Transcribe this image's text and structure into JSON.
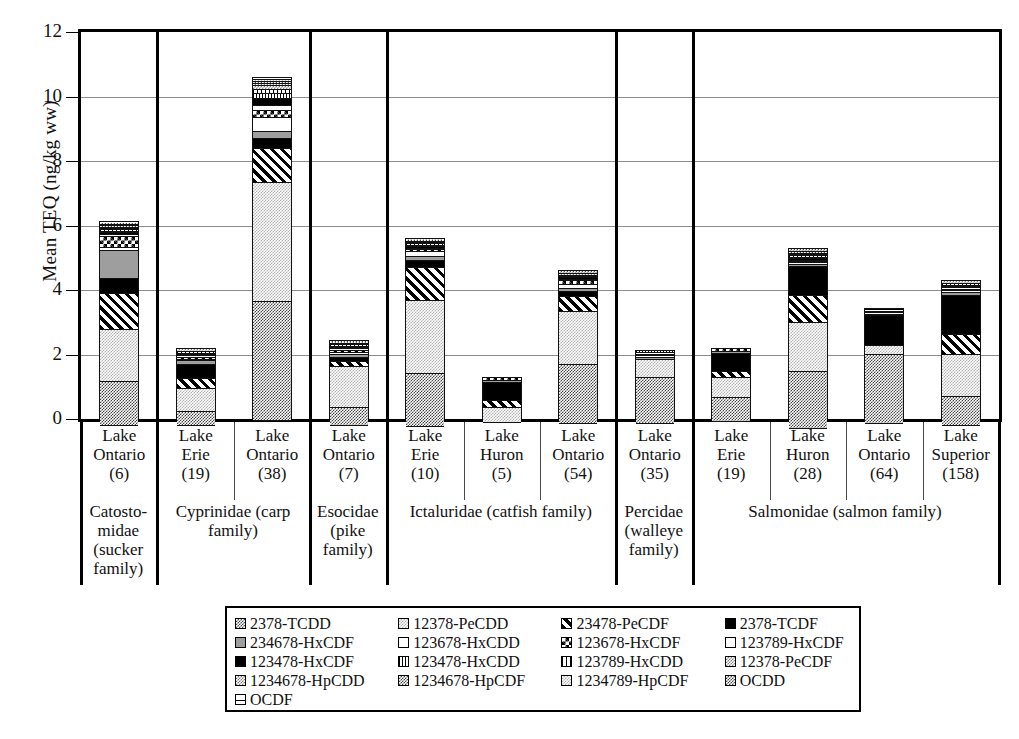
{
  "chart_data": {
    "type": "bar",
    "subtype": "stacked-bar",
    "title": "",
    "xlabel": "",
    "ylabel": "Mean TEQ (ng/kg ww)",
    "ylim": [
      0,
      12
    ],
    "yticks": [
      0,
      2,
      4,
      6,
      8,
      10,
      12
    ],
    "grid": true,
    "legend_position": "bottom",
    "categories": [
      "Lake Ontario (6)",
      "Lake Erie (19)",
      "Lake Ontario (38)",
      "Lake Ontario (7)",
      "Lake Erie (10)",
      "Lake Huron (5)",
      "Lake Ontario (54)",
      "Lake Ontario (35)",
      "Lake Erie (19)",
      "Lake Huron (28)",
      "Lake Ontario (64)",
      "Lake Superior (158)"
    ],
    "totals": [
      6.1,
      2.2,
      10.6,
      2.45,
      5.6,
      1.3,
      4.6,
      2.15,
      2.2,
      5.3,
      3.45,
      4.3
    ],
    "series": [
      {
        "name": "2378-TCDD",
        "values": [
          1.35,
          0.42,
          3.7,
          0.55,
          1.62,
          0.0,
          1.85,
          1.42,
          0.75,
          1.78,
          2.15,
          0.88
        ]
      },
      {
        "name": "12378-PeCDD",
        "values": [
          1.62,
          0.72,
          3.7,
          1.25,
          2.28,
          0.45,
          1.65,
          0.55,
          0.62,
          1.52,
          0.28,
          1.32
        ]
      },
      {
        "name": "23478-PeCDF",
        "values": [
          1.12,
          0.32,
          1.05,
          0.16,
          1.02,
          0.22,
          0.46,
          0.0,
          0.17,
          0.82,
          0.0,
          0.62
        ]
      },
      {
        "name": "2378-TCDF",
        "values": [
          0.46,
          0.42,
          0.3,
          0.14,
          0.22,
          0.58,
          0.14,
          0.0,
          0.58,
          0.92,
          0.92,
          1.22
        ]
      },
      {
        "name": "234678-HxCDF",
        "values": [
          0.85,
          0.12,
          0.22,
          0.1,
          0.11,
          0.02,
          0.1,
          0.08,
          0.04,
          0.06,
          0.04,
          0.09
        ]
      },
      {
        "name": "123678-HxCDD",
        "values": [
          0.12,
          0.05,
          0.44,
          0.06,
          0.16,
          0.01,
          0.14,
          0.04,
          0.02,
          0.04,
          0.02,
          0.05
        ]
      },
      {
        "name": "123678-HxCDF",
        "values": [
          0.34,
          0.06,
          0.2,
          0.06,
          0.07,
          0.01,
          0.1,
          0.03,
          0.01,
          0.03,
          0.01,
          0.04
        ]
      },
      {
        "name": "123789-HxCDF",
        "values": [
          0.06,
          0.02,
          0.18,
          0.03,
          0.04,
          0.0,
          0.05,
          0.01,
          0.0,
          0.02,
          0.01,
          0.02
        ]
      },
      {
        "name": "123478-HxCDF",
        "values": [
          0.05,
          0.02,
          0.2,
          0.03,
          0.03,
          0.0,
          0.04,
          0.01,
          0.0,
          0.02,
          0.01,
          0.02
        ]
      },
      {
        "name": "123478-HxCDD",
        "values": [
          0.04,
          0.01,
          0.16,
          0.02,
          0.02,
          0.0,
          0.03,
          0.01,
          0.0,
          0.02,
          0.0,
          0.01
        ]
      },
      {
        "name": "123789-HxCDD",
        "values": [
          0.03,
          0.01,
          0.12,
          0.02,
          0.01,
          0.0,
          0.02,
          0.0,
          0.0,
          0.01,
          0.0,
          0.01
        ]
      },
      {
        "name": "12378-PeCDF",
        "values": [
          0.03,
          0.01,
          0.12,
          0.01,
          0.01,
          0.0,
          0.01,
          0.0,
          0.0,
          0.01,
          0.0,
          0.01
        ]
      },
      {
        "name": "1234678-HpCDD",
        "values": [
          0.02,
          0.01,
          0.08,
          0.01,
          0.01,
          0.0,
          0.01,
          0.0,
          0.0,
          0.01,
          0.0,
          0.01
        ]
      },
      {
        "name": "1234678-HpCDF",
        "values": [
          0.02,
          0.0,
          0.06,
          0.01,
          0.01,
          0.0,
          0.01,
          0.0,
          0.0,
          0.01,
          0.0,
          0.0
        ]
      },
      {
        "name": "1234789-HpCDF",
        "values": [
          0.01,
          0.0,
          0.04,
          0.0,
          0.01,
          0.0,
          0.0,
          0.0,
          0.0,
          0.01,
          0.0,
          0.0
        ]
      },
      {
        "name": "OCDD",
        "values": [
          0.01,
          0.0,
          0.03,
          0.0,
          0.0,
          0.0,
          0.0,
          0.0,
          0.0,
          0.01,
          0.0,
          0.0
        ]
      },
      {
        "name": "OCDF",
        "values": [
          0.01,
          0.0,
          0.02,
          0.0,
          0.0,
          0.0,
          0.0,
          0.0,
          0.0,
          0.0,
          0.0,
          0.0
        ]
      }
    ]
  },
  "axis": {
    "y_title": "Mean TEQ (ng/kg ww)",
    "ticks": [
      "12",
      "10",
      "8",
      "6",
      "4",
      "2",
      "0"
    ]
  },
  "lakes": [
    {
      "name": "Lake Ontario",
      "n": "(6)"
    },
    {
      "name": "Lake Erie",
      "n": "(19)"
    },
    {
      "name": "Lake Ontario",
      "n": "(38)"
    },
    {
      "name": "Lake Ontario",
      "n": "(7)"
    },
    {
      "name": "Lake Erie",
      "n": "(10)"
    },
    {
      "name": "Lake Huron",
      "n": "(5)"
    },
    {
      "name": "Lake Ontario",
      "n": "(54)"
    },
    {
      "name": "Lake Ontario",
      "n": "(35)"
    },
    {
      "name": "Lake Erie",
      "n": "(19)"
    },
    {
      "name": "Lake Huron",
      "n": "(28)"
    },
    {
      "name": "Lake Ontario",
      "n": "(64)"
    },
    {
      "name": "Lake Superior",
      "n": "(158)"
    }
  ],
  "families": [
    {
      "label": "Catosto-midae (sucker family)",
      "span": 1
    },
    {
      "label": "Cyprinidae (carp family)",
      "span": 2
    },
    {
      "label": "Esocidae (pike family)",
      "span": 1
    },
    {
      "label": "Ictaluridae (catfish family)",
      "span": 3
    },
    {
      "label": "Percidae (walleye family)",
      "span": 1
    },
    {
      "label": "Salmonidae (salmon family)",
      "span": 4
    }
  ],
  "legend": {
    "rows": [
      [
        {
          "label": "2378-TCDD",
          "pattern": "dither-dark"
        },
        {
          "label": "12378-PeCDD",
          "pattern": "dither-light"
        },
        {
          "label": "23478-PeCDF",
          "pattern": "hatch-fwd"
        },
        {
          "label": "2378-TCDF",
          "pattern": "solid-black"
        }
      ],
      [
        {
          "label": "234678-HxCDF",
          "pattern": "gray-mid"
        },
        {
          "label": "123678-HxCDD",
          "pattern": "white"
        },
        {
          "label": "123678-HxCDF",
          "pattern": "checker"
        },
        {
          "label": "123789-HxCDF",
          "pattern": "white"
        }
      ],
      [
        {
          "label": "123478-HxCDF",
          "pattern": "solid-black"
        },
        {
          "label": "123478-HxCDD",
          "pattern": "dots-dense"
        },
        {
          "label": "123789-HxCDD",
          "pattern": "vlines"
        },
        {
          "label": "12378-PeCDF",
          "pattern": "dither-mid"
        }
      ],
      [
        {
          "label": "1234678-HpCDD",
          "pattern": "dither-mid"
        },
        {
          "label": "1234678-HpCDF",
          "pattern": "dither-dark"
        },
        {
          "label": "1234789-HpCDF",
          "pattern": "dither-light"
        },
        {
          "label": "OCDD",
          "pattern": "dither-dark"
        }
      ],
      [
        {
          "label": "OCDF",
          "pattern": "band"
        }
      ]
    ]
  }
}
